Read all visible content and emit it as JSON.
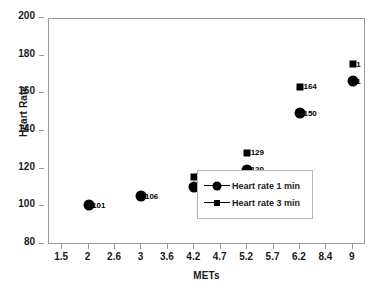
{
  "chart_data": {
    "type": "scatter",
    "title": "",
    "xlabel": "METs",
    "ylabel": "Heart Rate",
    "ylim": [
      80,
      200
    ],
    "yticks": [
      200,
      180,
      160,
      140,
      120,
      100,
      80
    ],
    "categories": [
      "1.5",
      "2",
      "2.6",
      "3",
      "3.6",
      "4.2",
      "4.7",
      "5.2",
      "5.7",
      "6.2",
      "8.4",
      "9"
    ],
    "grid": false,
    "legend_position": "lower-right",
    "series": [
      {
        "name": "Heart rate 1 min",
        "marker": "circle",
        "color": "#000000",
        "points": [
          {
            "category": "2",
            "value": 101,
            "label": "101"
          },
          {
            "category": "3",
            "value": 106,
            "label": "106"
          },
          {
            "category": "4.2",
            "value": 111,
            "label": "111"
          },
          {
            "category": "5.2",
            "value": 120,
            "label": "120"
          },
          {
            "category": "6.2",
            "value": 150,
            "label": "150"
          },
          {
            "category": "9",
            "value": 167,
            "label": "1"
          }
        ]
      },
      {
        "name": "Heart rate 3 min",
        "marker": "square",
        "color": "#000000",
        "points": [
          {
            "category": "4.2",
            "value": 116,
            "label": "116"
          },
          {
            "category": "5.2",
            "value": 129,
            "label": "129"
          },
          {
            "category": "6.2",
            "value": 164,
            "label": "164"
          },
          {
            "category": "9",
            "value": 176,
            "label": "1"
          }
        ]
      }
    ]
  },
  "legend": {
    "entries": [
      {
        "label": "Heart rate 1 min",
        "marker": "circle"
      },
      {
        "label": "Heart rate 3 min",
        "marker": "square"
      }
    ]
  },
  "caption": {
    "text": ""
  }
}
